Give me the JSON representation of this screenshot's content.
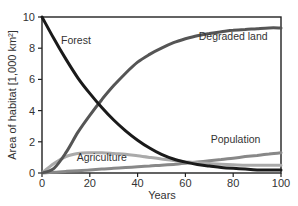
{
  "chart_data": {
    "type": "line",
    "title": "",
    "xlabel": "Years",
    "ylabel": "Area of habitat [1,000 km²]",
    "xlim": [
      0,
      100
    ],
    "ylim": [
      0,
      10
    ],
    "x_ticks": [
      "0",
      "20",
      "40",
      "60",
      "80",
      "100"
    ],
    "y_ticks": [
      "0",
      "2",
      "4",
      "6",
      "8",
      "10"
    ],
    "grid": false,
    "legend": "inline labels",
    "x": [
      0,
      5,
      10,
      15,
      20,
      25,
      30,
      35,
      40,
      45,
      50,
      55,
      60,
      65,
      70,
      75,
      80,
      85,
      90,
      95,
      100
    ],
    "series": [
      {
        "name": "Forest",
        "color": "#1a1a1a",
        "values": [
          10.0,
          8.6,
          7.3,
          6.1,
          5.1,
          4.2,
          3.4,
          2.7,
          2.1,
          1.6,
          1.2,
          0.9,
          0.7,
          0.55,
          0.45,
          0.35,
          0.3,
          0.25,
          0.2,
          0.2,
          0.2
        ]
      },
      {
        "name": "Degraded land",
        "color": "#555555",
        "values": [
          0.0,
          0.3,
          1.3,
          2.6,
          3.7,
          4.7,
          5.6,
          6.4,
          7.1,
          7.6,
          8.0,
          8.35,
          8.6,
          8.8,
          8.95,
          9.05,
          9.15,
          9.2,
          9.25,
          9.3,
          9.3
        ]
      },
      {
        "name": "Agriculture",
        "color": "#aaaaaa",
        "values": [
          0.0,
          0.6,
          1.05,
          1.25,
          1.3,
          1.3,
          1.25,
          1.2,
          1.1,
          1.0,
          0.9,
          0.8,
          0.72,
          0.66,
          0.6,
          0.56,
          0.53,
          0.5,
          0.5,
          0.5,
          0.5
        ]
      },
      {
        "name": "Population",
        "color": "#888888",
        "values": [
          0.0,
          0.05,
          0.1,
          0.15,
          0.2,
          0.25,
          0.3,
          0.35,
          0.4,
          0.45,
          0.5,
          0.55,
          0.62,
          0.7,
          0.78,
          0.86,
          0.95,
          1.05,
          1.13,
          1.22,
          1.3
        ]
      }
    ],
    "annotations": [
      {
        "text": "Forest",
        "x": 8,
        "y": 8.3
      },
      {
        "text": "Degraded land",
        "x": 80,
        "y": 8.5
      },
      {
        "text": "Agriculture",
        "x": 25,
        "y": 0.8
      },
      {
        "text": "Population",
        "x": 81,
        "y": 1.9
      }
    ]
  }
}
